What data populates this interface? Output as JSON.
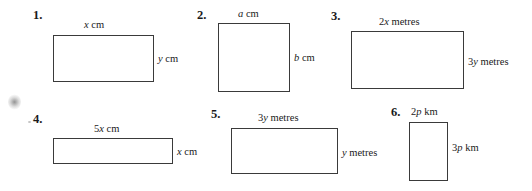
{
  "page": {
    "background_color": "#ffffff",
    "ink_color": "#1a1a1a",
    "rule_color": "#3a3a3a"
  },
  "exercises": [
    {
      "number": "1.",
      "shape": "rectangle",
      "top_label": {
        "coefficient": "",
        "variable": "x",
        "unit": "cm",
        "text": "x cm"
      },
      "side_label": {
        "coefficient": "",
        "variable": "y",
        "unit": "cm",
        "text": "y cm"
      },
      "rect": {
        "left": 53,
        "top": 35,
        "width": 101,
        "height": 47
      }
    },
    {
      "number": "2.",
      "shape": "rectangle",
      "top_label": {
        "coefficient": "",
        "variable": "a",
        "unit": "cm",
        "text": "a cm"
      },
      "side_label": {
        "coefficient": "",
        "variable": "b",
        "unit": "cm",
        "text": "b cm"
      },
      "rect": {
        "left": 218,
        "top": 23,
        "width": 72,
        "height": 69
      }
    },
    {
      "number": "3.",
      "shape": "rectangle",
      "top_label": {
        "coefficient": "2",
        "variable": "x",
        "unit": "metres",
        "text": "2x metres"
      },
      "side_label": {
        "coefficient": "3",
        "variable": "y",
        "unit": "metres",
        "text": "3y metres"
      },
      "rect": {
        "left": 351,
        "top": 31,
        "width": 113,
        "height": 58
      }
    },
    {
      "number": "4.",
      "shape": "rectangle",
      "top_label": {
        "coefficient": "5",
        "variable": "x",
        "unit": "cm",
        "text": "5x cm"
      },
      "side_label": {
        "coefficient": "",
        "variable": "x",
        "unit": "cm",
        "text": "x cm"
      },
      "rect": {
        "left": 53,
        "top": 138,
        "width": 120,
        "height": 26
      }
    },
    {
      "number": "5.",
      "shape": "rectangle",
      "top_label": {
        "coefficient": "3",
        "variable": "y",
        "unit": "metres",
        "text": "3y metres"
      },
      "side_label": {
        "coefficient": "",
        "variable": "y",
        "unit": "metres",
        "text": "y metres"
      },
      "rect": {
        "left": 231,
        "top": 128,
        "width": 107,
        "height": 46
      }
    },
    {
      "number": "6.",
      "shape": "rectangle",
      "top_label": {
        "coefficient": "2",
        "variable": "p",
        "unit": "km",
        "text": "2p km"
      },
      "side_label": {
        "coefficient": "3",
        "variable": "p",
        "unit": "km",
        "text": "3p km"
      },
      "rect": {
        "left": 409,
        "top": 122,
        "width": 39,
        "height": 59
      }
    }
  ]
}
